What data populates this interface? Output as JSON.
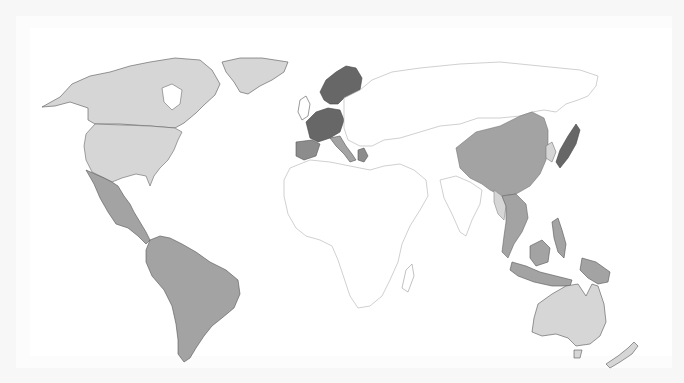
{
  "map": {
    "type": "choropleth",
    "projection": "equirectangular-world",
    "legend": null,
    "title": null,
    "palette": {
      "none": "#ffffff",
      "light": "#d6d6d6",
      "medium": "#a3a3a3",
      "medium_dark": "#8c8c8c",
      "dark": "#676767",
      "border_light": "#c8c8c8",
      "border_dark": "#555555"
    },
    "regions": [
      {
        "name": "Canada",
        "category": "light"
      },
      {
        "name": "United States",
        "category": "light"
      },
      {
        "name": "Greenland",
        "category": "light"
      },
      {
        "name": "Mexico",
        "category": "medium"
      },
      {
        "name": "Central America",
        "category": "medium"
      },
      {
        "name": "South America",
        "category": "medium"
      },
      {
        "name": "Scandinavia",
        "category": "dark"
      },
      {
        "name": "United Kingdom",
        "category": "none"
      },
      {
        "name": "France / Germany / Benelux",
        "category": "dark"
      },
      {
        "name": "Iberia",
        "category": "medium_dark"
      },
      {
        "name": "Italy",
        "category": "medium"
      },
      {
        "name": "Greece",
        "category": "medium_dark"
      },
      {
        "name": "Eastern Europe",
        "category": "none"
      },
      {
        "name": "Russia",
        "category": "none"
      },
      {
        "name": "Central Asia",
        "category": "none"
      },
      {
        "name": "Middle East",
        "category": "none"
      },
      {
        "name": "Africa",
        "category": "none"
      },
      {
        "name": "India",
        "category": "none"
      },
      {
        "name": "China",
        "category": "medium"
      },
      {
        "name": "Korea",
        "category": "light"
      },
      {
        "name": "Japan",
        "category": "dark"
      },
      {
        "name": "Myanmar",
        "category": "light"
      },
      {
        "name": "Mainland Southeast Asia",
        "category": "medium"
      },
      {
        "name": "Philippines",
        "category": "medium"
      },
      {
        "name": "Indonesia / Malaysia",
        "category": "medium"
      },
      {
        "name": "Papua New Guinea",
        "category": "medium"
      },
      {
        "name": "Australia",
        "category": "light"
      },
      {
        "name": "New Zealand",
        "category": "light"
      }
    ]
  }
}
